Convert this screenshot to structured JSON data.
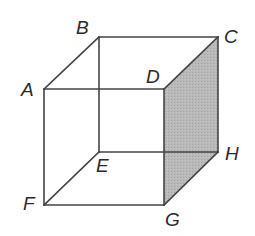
{
  "diagram": {
    "type": "cube",
    "colors": {
      "edge": "#454545",
      "shade": "#b9b9b9",
      "shade_dot": "#a5a5a5",
      "label": "#2a2a2a",
      "background": "#ffffff"
    },
    "vertices": {
      "A": {
        "label": "A",
        "x": 44,
        "y": 89
      },
      "B": {
        "label": "B",
        "x": 99,
        "y": 37
      },
      "C": {
        "label": "C",
        "x": 218,
        "y": 37
      },
      "D": {
        "label": "D",
        "x": 164,
        "y": 89
      },
      "E": {
        "label": "E",
        "x": 99,
        "y": 152
      },
      "F": {
        "label": "F",
        "x": 44,
        "y": 205
      },
      "G": {
        "label": "G",
        "x": 164,
        "y": 205
      },
      "H": {
        "label": "H",
        "x": 218,
        "y": 152
      }
    },
    "edges": [
      [
        "A",
        "B"
      ],
      [
        "B",
        "C"
      ],
      [
        "C",
        "D"
      ],
      [
        "D",
        "A"
      ],
      [
        "F",
        "G"
      ],
      [
        "G",
        "H"
      ],
      [
        "H",
        "E"
      ],
      [
        "E",
        "F"
      ],
      [
        "A",
        "F"
      ],
      [
        "B",
        "E"
      ],
      [
        "C",
        "H"
      ],
      [
        "D",
        "G"
      ]
    ],
    "shaded_face": [
      "D",
      "C",
      "H",
      "G"
    ],
    "labels": {
      "A": "A",
      "B": "B",
      "C": "C",
      "D": "D",
      "E": "E",
      "F": "F",
      "G": "G",
      "H": "H"
    }
  }
}
